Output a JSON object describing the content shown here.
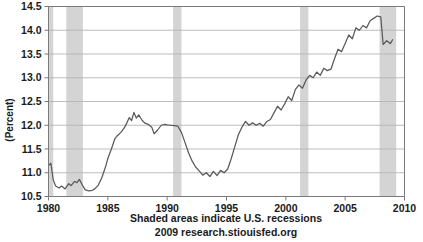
{
  "chart_data": {
    "type": "line",
    "title": "",
    "xlabel": "",
    "ylabel": "(Percent)",
    "xlim": [
      1980,
      2010
    ],
    "ylim": [
      10.5,
      14.5
    ],
    "grid": true,
    "legend": "none",
    "line_color": "#595959",
    "recession_band_color": "#d4d4d4",
    "axis_color": "#7a7a7a",
    "gridline_color": "#b5b5b5",
    "xticks": [
      1980,
      1985,
      1990,
      1995,
      2000,
      2005,
      2010
    ],
    "xtick_labels": [
      "1980",
      "1985",
      "1990",
      "1995",
      "2000",
      "2005",
      "2010"
    ],
    "yticks": [
      10.5,
      11.0,
      11.5,
      12.0,
      12.5,
      13.0,
      13.5,
      14.0,
      14.5
    ],
    "ytick_labels": [
      "10.5",
      "11.0",
      "11.5",
      "12.0",
      "12.5",
      "13.0",
      "13.5",
      "14.0",
      "14.5"
    ],
    "recessions": [
      {
        "start": 1980.05,
        "end": 1980.4
      },
      {
        "start": 1981.5,
        "end": 1982.9
      },
      {
        "start": 1990.5,
        "end": 1991.2
      },
      {
        "start": 2001.2,
        "end": 2001.9
      },
      {
        "start": 2007.9,
        "end": 2009.3
      }
    ],
    "series": [
      {
        "name": "Percent",
        "x": [
          1980.0,
          1980.2,
          1980.4,
          1980.6,
          1980.9,
          1981.1,
          1981.4,
          1981.7,
          1981.9,
          1982.2,
          1982.4,
          1982.6,
          1982.9,
          1983.1,
          1983.4,
          1983.7,
          1983.9,
          1984.2,
          1984.5,
          1984.8,
          1985.0,
          1985.3,
          1985.6,
          1985.8,
          1986.1,
          1986.4,
          1986.6,
          1986.8,
          1987.0,
          1987.2,
          1987.4,
          1987.6,
          1987.9,
          1988.1,
          1988.4,
          1988.7,
          1988.9,
          1989.2,
          1989.5,
          1989.8,
          1990.0,
          1990.3,
          1990.6,
          1990.9,
          1991.2,
          1991.5,
          1991.8,
          1992.1,
          1992.4,
          1992.7,
          1993.0,
          1993.3,
          1993.6,
          1993.9,
          1994.2,
          1994.5,
          1994.8,
          1995.1,
          1995.4,
          1995.7,
          1996.0,
          1996.3,
          1996.6,
          1996.9,
          1997.2,
          1997.5,
          1997.8,
          1998.1,
          1998.4,
          1998.7,
          1999.0,
          1999.3,
          1999.6,
          1999.9,
          2000.2,
          2000.5,
          2000.8,
          2001.1,
          2001.4,
          2001.7,
          2002.0,
          2002.3,
          2002.6,
          2002.9,
          2003.2,
          2003.5,
          2003.8,
          2004.1,
          2004.4,
          2004.7,
          2005.0,
          2005.3,
          2005.6,
          2005.9,
          2006.2,
          2006.5,
          2006.8,
          2007.1,
          2007.4,
          2007.7,
          2008.0,
          2008.2,
          2008.5,
          2008.8,
          2009.0
        ],
        "values": [
          11.15,
          11.2,
          10.85,
          10.72,
          10.68,
          10.72,
          10.66,
          10.77,
          10.73,
          10.82,
          10.79,
          10.86,
          10.72,
          10.64,
          10.62,
          10.63,
          10.66,
          10.74,
          10.9,
          11.12,
          11.3,
          11.5,
          11.72,
          11.78,
          11.85,
          11.95,
          12.05,
          12.16,
          12.1,
          12.27,
          12.15,
          12.22,
          12.1,
          12.05,
          12.02,
          11.96,
          11.82,
          11.9,
          12.0,
          12.02,
          12.01,
          12.0,
          11.99,
          11.98,
          11.85,
          11.64,
          11.42,
          11.25,
          11.12,
          11.04,
          10.95,
          11.0,
          10.92,
          11.03,
          10.94,
          11.05,
          11.0,
          11.08,
          11.3,
          11.55,
          11.8,
          11.96,
          12.08,
          12.0,
          12.05,
          12.0,
          12.04,
          11.98,
          12.08,
          12.12,
          12.26,
          12.4,
          12.32,
          12.45,
          12.6,
          12.52,
          12.75,
          12.85,
          12.78,
          12.95,
          13.05,
          13.0,
          13.12,
          13.05,
          13.2,
          13.15,
          13.18,
          13.4,
          13.6,
          13.55,
          13.72,
          13.9,
          13.82,
          14.05,
          14.0,
          14.1,
          14.05,
          14.2,
          14.25,
          14.3,
          14.28,
          13.7,
          13.78,
          13.72,
          13.8
        ]
      }
    ],
    "caption_line1": "Shaded areas indicate U.S. recessions",
    "caption_line2": "2009 research.stiouisfed.org"
  }
}
